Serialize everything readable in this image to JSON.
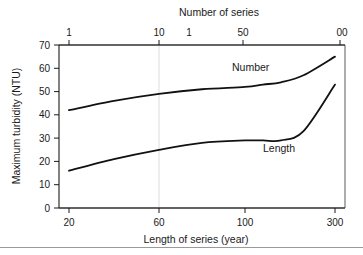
{
  "chart_data": {
    "type": "line",
    "title": "",
    "xlabel": "Length of series (year)",
    "ylabel": "Maximum turbidity (NTU)",
    "top_axis_label": "Number of series",
    "xlim": [
      20,
      300
    ],
    "ylim": [
      0,
      70
    ],
    "grid": false,
    "legend": "inline-labels",
    "x_ticks": [
      "20",
      "60",
      "100",
      "300"
    ],
    "x_tick_values": [
      20,
      60,
      100,
      300
    ],
    "y_ticks": [
      "0",
      "10",
      "20",
      "30",
      "40",
      "50",
      "60",
      "70"
    ],
    "y_tick_values": [
      0,
      10,
      20,
      30,
      40,
      50,
      60,
      70
    ],
    "top_x_ticks": [
      "1",
      "10",
      "1",
      "50",
      "00"
    ],
    "series": [
      {
        "name": "Number",
        "label": "Number",
        "x": [
          20,
          40,
          60,
          80,
          100,
          140,
          180,
          230,
          300
        ],
        "values": [
          42,
          46,
          49,
          51,
          52,
          53,
          54,
          57,
          65
        ]
      },
      {
        "name": "Length",
        "label": "Length",
        "x": [
          20,
          40,
          60,
          80,
          100,
          140,
          180,
          230,
          300
        ],
        "values": [
          16,
          21,
          25,
          28,
          29,
          29,
          29,
          33,
          53
        ]
      }
    ]
  },
  "chart": {
    "y_axis_title": "Maximum turbidity (NTU)",
    "x_axis_title": "Length of series (year)",
    "top_axis_title": "Number of series",
    "y_labels": {
      "t0": "0",
      "t10": "10",
      "t20": "20",
      "t30": "30",
      "t40": "40",
      "t50": "50",
      "t60": "60",
      "t70": "70"
    },
    "x_labels": {
      "x20": "20",
      "x60": "60",
      "x100": "100",
      "x300": "300"
    },
    "top_labels": {
      "a": "1",
      "b": "10",
      "c": "1",
      "d": "50",
      "e": "00"
    },
    "series_labels": {
      "number": "Number",
      "length": "Length"
    },
    "colors": {
      "curve": "#111111",
      "frame": "#5a5a5a",
      "axis": "#1a1a1a",
      "gridline": "#dcdcdc",
      "background": "#ffffff"
    }
  }
}
